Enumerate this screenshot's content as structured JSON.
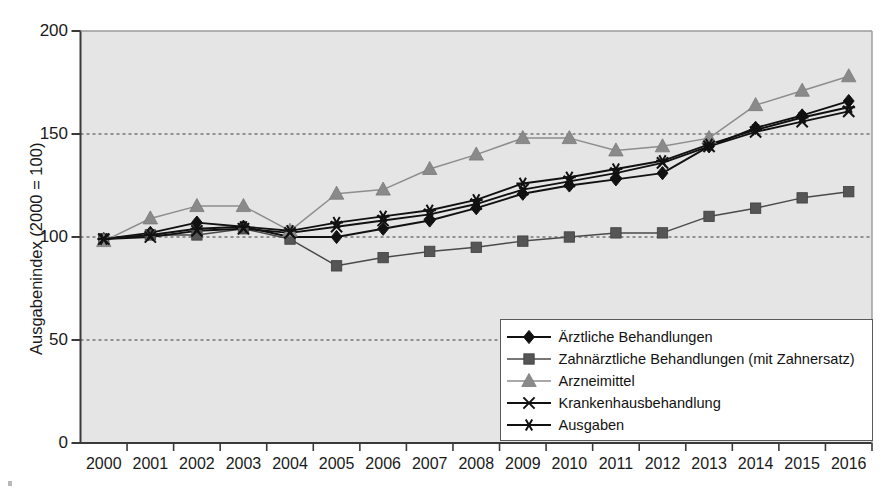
{
  "chart_data": {
    "type": "line",
    "title": "",
    "xlabel": "",
    "ylabel": "Ausgabenindex (2000 = 100)",
    "ylim": [
      0,
      200
    ],
    "yticks": [
      0,
      50,
      100,
      150,
      200
    ],
    "ytick_labels": [
      "0",
      "50",
      "100",
      "150",
      "200"
    ],
    "grid": "horizontal-dashed",
    "gridlines": [
      50,
      100,
      150
    ],
    "legend_position": "bottom-right-inside",
    "plot_background": "#e5e5e5",
    "categories": [
      "2000",
      "2001",
      "2002",
      "2003",
      "2004",
      "2005",
      "2006",
      "2007",
      "2008",
      "2009",
      "2010",
      "2011",
      "2012",
      "2013",
      "2014",
      "2015",
      "2016"
    ],
    "x": [
      2000,
      2001,
      2002,
      2003,
      2004,
      2005,
      2006,
      2007,
      2008,
      2009,
      2010,
      2011,
      2012,
      2013,
      2014,
      2015,
      2016
    ],
    "series": [
      {
        "name": "Ärztliche Behandlungen",
        "marker": "diamond",
        "color": "#111111",
        "marker_color": "#111111",
        "values": [
          99,
          102,
          107,
          105,
          100,
          100,
          104,
          108,
          114,
          121,
          125,
          128,
          131,
          144,
          153,
          159,
          166
        ]
      },
      {
        "name": "Zahnärztliche Behandlungen (mit Zahnersatz)",
        "marker": "square",
        "color": "#4a4a4a",
        "marker_color": "#555555",
        "values": [
          99,
          101,
          101,
          104,
          99,
          86,
          90,
          93,
          95,
          98,
          100,
          102,
          102,
          110,
          114,
          119,
          122
        ]
      },
      {
        "name": "Arzneimittel",
        "marker": "triangle",
        "color": "#8d8d8d",
        "marker_color": "#8a8a8a",
        "values": [
          98,
          109,
          115,
          115,
          103,
          121,
          123,
          133,
          140,
          148,
          148,
          142,
          144,
          148,
          164,
          171,
          178
        ]
      },
      {
        "name": "Krankenhausbehandlung",
        "marker": "x",
        "color": "#111111",
        "marker_color": "#111111",
        "values": [
          99,
          100,
          103,
          104,
          102,
          105,
          108,
          111,
          116,
          123,
          127,
          131,
          136,
          144,
          151,
          156,
          161
        ]
      },
      {
        "name": "Ausgaben",
        "marker": "asterisk",
        "color": "#111111",
        "marker_color": "#111111",
        "values": [
          99,
          101,
          104,
          105,
          103,
          107,
          110,
          113,
          118,
          126,
          129,
          133,
          137,
          145,
          152,
          158,
          163
        ]
      }
    ]
  }
}
